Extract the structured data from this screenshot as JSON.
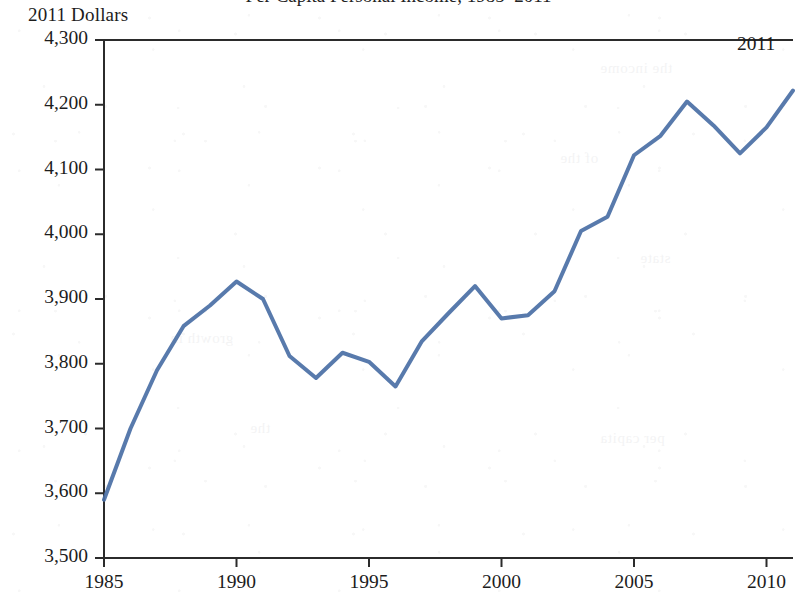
{
  "figure": {
    "unit_caption": "2011 Dollars",
    "title_remnant": "Per Capita Personal Income, 1985–2011",
    "ghost_fragments": [
      {
        "text": "the income",
        "x": 600,
        "y": 60
      },
      {
        "text": "of the",
        "x": 560,
        "y": 150
      },
      {
        "text": "state",
        "x": 640,
        "y": 250
      },
      {
        "text": "growth in",
        "x": 170,
        "y": 330
      },
      {
        "text": "the",
        "x": 250,
        "y": 420
      },
      {
        "text": "per capita",
        "x": 600,
        "y": 430
      }
    ]
  },
  "chart_data": {
    "type": "line",
    "title": "Per Capita Personal Income, 1985–2011",
    "xlabel": "",
    "ylabel": "2011 Dollars",
    "ylim": [
      3500,
      4300
    ],
    "xlim": [
      1985,
      2011
    ],
    "grid": false,
    "legend": null,
    "line_color": "#4a6fa5",
    "line_width": 4,
    "y_ticks": [
      3500,
      3600,
      3700,
      3800,
      3900,
      4000,
      4100,
      4200,
      4300
    ],
    "y_tick_labels": [
      "3,500",
      "3,600",
      "3,700",
      "3,800",
      "3,900",
      "4,000",
      "4,100",
      "4,200",
      "4,300"
    ],
    "x_ticks": [
      1985,
      1990,
      1995,
      2000,
      2005,
      2010
    ],
    "x_tick_labels": [
      "1985",
      "1990",
      "1995",
      "2000",
      "2005",
      "2010"
    ],
    "annotations": [
      {
        "text": "2011",
        "x": 2011,
        "y": 4222,
        "position": "above-left"
      }
    ],
    "x": [
      1985,
      1986,
      1987,
      1988,
      1989,
      1990,
      1991,
      1992,
      1993,
      1994,
      1995,
      1996,
      1997,
      1998,
      1999,
      2000,
      2001,
      2002,
      2003,
      2004,
      2005,
      2006,
      2007,
      2008,
      2009,
      2010,
      2011
    ],
    "values": [
      3590,
      3700,
      3790,
      3858,
      3890,
      3927,
      3900,
      3812,
      3778,
      3817,
      3803,
      3765,
      3835,
      3878,
      3920,
      3870,
      3875,
      3912,
      4005,
      4027,
      4122,
      4152,
      4205,
      4168,
      4125,
      4165,
      4222
    ]
  }
}
